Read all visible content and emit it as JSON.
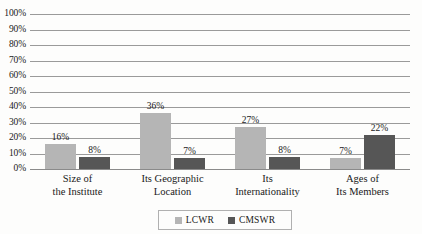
{
  "chart_data": {
    "type": "bar",
    "title": "",
    "subtitle": "",
    "xlabel": "",
    "ylabel": "",
    "ylim": [
      0,
      100
    ],
    "grid": true,
    "legend_position": "bottom-center",
    "value_suffix": "%",
    "categories": [
      "Size of the Institute",
      "Its Geographic Location",
      "Its Internationality",
      "Ages of Its Members"
    ],
    "category_lines": [
      [
        "Size of",
        "the Institute"
      ],
      [
        "Its Geographic",
        "Location"
      ],
      [
        "Its",
        "Internationality"
      ],
      [
        "Ages of",
        "Its Members"
      ]
    ],
    "series": [
      {
        "name": "LCWR",
        "color": "#b5b5b5",
        "values": [
          16,
          36,
          27,
          7
        ],
        "labels": [
          "16%",
          "36%",
          "27%",
          "7%"
        ]
      },
      {
        "name": "CMSWR",
        "color": "#565656",
        "values": [
          8,
          7,
          8,
          22
        ],
        "labels": [
          "8%",
          "7%",
          "8%",
          "22%"
        ]
      }
    ],
    "y_ticks": [
      0,
      10,
      20,
      30,
      40,
      50,
      60,
      70,
      80,
      90,
      100
    ],
    "y_tick_labels": [
      "0%",
      "10%",
      "20%",
      "30%",
      "40%",
      "50%",
      "60%",
      "70%",
      "80%",
      "90%",
      "100%"
    ]
  },
  "legend": {
    "items": [
      {
        "label": "LCWR"
      },
      {
        "label": "CMSWR"
      }
    ]
  }
}
